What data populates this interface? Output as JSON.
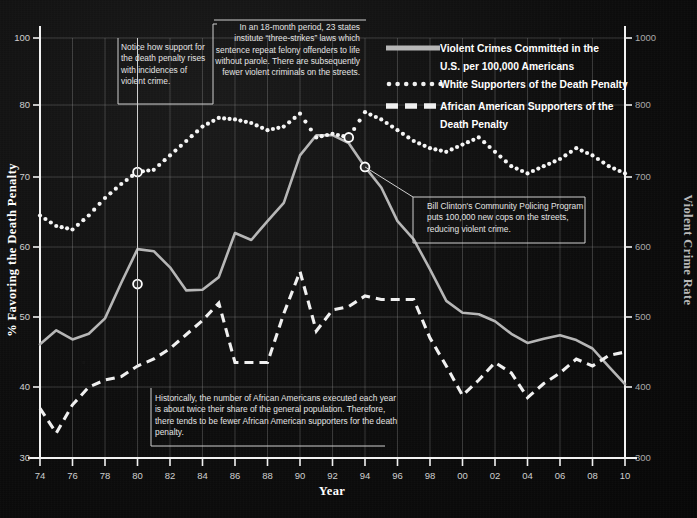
{
  "chart_data": {
    "type": "line",
    "title": "",
    "xlabel": "Year",
    "ylabel": "% Favoring the Death Penalty",
    "y2label": "Violent Crime Rate",
    "xlim": [
      1974,
      2010
    ],
    "ylim": [
      30,
      100
    ],
    "y2lim": [
      300,
      1000
    ],
    "grid": true,
    "legend_position": "top-right",
    "x_ticks": [
      "74",
      "76",
      "78",
      "80",
      "82",
      "84",
      "86",
      "88",
      "90",
      "92",
      "94",
      "96",
      "98",
      "00",
      "02",
      "04",
      "06",
      "08",
      "10"
    ],
    "y_ticks": [
      "30",
      "40",
      "50",
      "60",
      "70",
      "80",
      "100"
    ],
    "y2_ticks": [
      "300",
      "400",
      "500",
      "600",
      "700",
      "800",
      "1000"
    ],
    "x": [
      1974,
      1975,
      1976,
      1977,
      1978,
      1979,
      1980,
      1981,
      1982,
      1983,
      1984,
      1985,
      1986,
      1987,
      1988,
      1989,
      1990,
      1991,
      1992,
      1993,
      1994,
      1995,
      1996,
      1997,
      1998,
      1999,
      2000,
      2001,
      2002,
      2003,
      2004,
      2005,
      2006,
      2007,
      2008,
      2009,
      2010
    ],
    "series": [
      {
        "name": "Violent Crimes Committed in the U.S. per 100,000 Americans",
        "style": "solid",
        "axis": "right",
        "units": "per 100,000",
        "values": [
          461,
          481,
          468,
          476,
          498,
          549,
          597,
          594,
          571,
          538,
          539,
          557,
          620,
          610,
          637,
          663,
          730,
          758,
          758,
          747,
          714,
          685,
          637,
          611,
          568,
          523,
          506,
          504,
          494,
          476,
          463,
          469,
          474,
          467,
          455,
          429,
          404
        ]
      },
      {
        "name": "White Supporters of the Death Penalty",
        "style": "dotted",
        "axis": "left",
        "units": "percent",
        "values": [
          64.5,
          63,
          62.5,
          64.5,
          67,
          69,
          70.7,
          71,
          73,
          75,
          77,
          78.2,
          78,
          77.5,
          76.5,
          77,
          78.8,
          75.5,
          76,
          75.5,
          79,
          78,
          76.5,
          75,
          74,
          73.5,
          74.5,
          75.5,
          73.5,
          71.5,
          70.5,
          71.5,
          72.5,
          74,
          73,
          71.5,
          70.5
        ]
      },
      {
        "name": "African American Supporters of the Death Penalty",
        "style": "dashed",
        "axis": "left",
        "units": "percent",
        "values": [
          37,
          33.5,
          37.5,
          40,
          41,
          41.5,
          43,
          44,
          45.5,
          47.5,
          49.5,
          52,
          43.5,
          43.5,
          43.5,
          50.5,
          56.5,
          48,
          51,
          51.5,
          53,
          52.5,
          52.5,
          52.5,
          47,
          43,
          38.8,
          41,
          43.5,
          42,
          38.5,
          40.5,
          42,
          44,
          43,
          44.5,
          45
        ]
      }
    ],
    "markers": [
      {
        "series": "White Supporters of the Death Penalty",
        "x": 1980,
        "y": 70.7
      },
      {
        "series": "Violent Crimes Committed in the U.S. per 100,000 Americans",
        "x": 1980,
        "y": 547
      },
      {
        "series": "White Supporters of the Death Penalty",
        "x": 1993,
        "y": 75.5
      },
      {
        "series": "Violent Crimes Committed in the U.S. per 100,000 Americans",
        "x": 1994,
        "y": 714
      }
    ]
  },
  "legend": {
    "items": [
      {
        "label_line1": "Violent Crimes Committed in the",
        "label_line2": "U.S. per 100,000 Americans",
        "style": "solid"
      },
      {
        "label_line1": "White Supporters of the Death Penalty",
        "label_line2": "",
        "style": "dotted"
      },
      {
        "label_line1": "African American Supporters of the",
        "label_line2": "Death Penalty",
        "style": "dashed"
      }
    ]
  },
  "annotations": [
    {
      "id": "support-rises",
      "text": "Notice how support for the death penalty rises with incidences of violent crime.",
      "align": "left"
    },
    {
      "id": "three-strikes",
      "text": "In an 18-month period, 23 states institute “three-strikes” laws which sentence repeat felony offenders to life without parole. There are subsequently fewer violent criminals on the streets.",
      "align": "right"
    },
    {
      "id": "community-policing",
      "text": "Bill Clinton's Community Policing Program puts 100,000 new cops on the streets, reducing  violent crime.",
      "align": "left"
    },
    {
      "id": "african-american-executions",
      "text": "Historically, the number of African Americans executed each year is about twice their share of the general population. Therefore, there tends to be fewer African American supporters for the death penalty.",
      "align": "left"
    }
  ],
  "colors": {
    "background": "#0d0d0d",
    "axis": "#f2f2f2",
    "grid": "#9a9a9a",
    "solid_series": "#b6b6b6",
    "dotted_series": "#f5f5f5",
    "dashed_series": "#f0f0f0",
    "text": "#e8e8e8"
  }
}
